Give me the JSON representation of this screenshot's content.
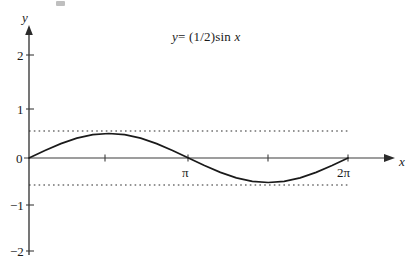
{
  "figure": {
    "title_parts": {
      "lhs": "y",
      "eq": "= (1/2)sin",
      "var": "x"
    },
    "background_color": "#ffffff",
    "ink_color": "#1a1a1a",
    "axis_color": "#3d3d3d"
  },
  "axes": {
    "x_axis_name": "x",
    "y_axis_name": "y",
    "x_ticks": [
      {
        "value": "pi/2",
        "label": ""
      },
      {
        "value": "pi",
        "label": "π"
      },
      {
        "value": "3pi/2",
        "label": ""
      },
      {
        "value": "2pi",
        "label": "2π"
      }
    ],
    "y_ticks": [
      {
        "value": 2,
        "label": "2"
      },
      {
        "value": 1,
        "label": "1"
      },
      {
        "value": 0,
        "label": "0"
      },
      {
        "value": -1,
        "label": "−1"
      },
      {
        "value": -2,
        "label": "−2"
      }
    ],
    "guide_lines": [
      {
        "value": 0.5,
        "style": "dotted"
      },
      {
        "value": -0.5,
        "style": "dotted"
      }
    ]
  },
  "chart_data": {
    "type": "line",
    "xlabel": "x",
    "ylabel": "y",
    "xlim": [
      0,
      7.33
    ],
    "ylim": [
      -2.35,
      2.35
    ],
    "grid": false,
    "legend": "none",
    "amplitude": 0.5,
    "period": 6.283185307,
    "equation": "y = 0.5*sin(x)",
    "xtick_values": [
      1.5707963,
      3.1415927,
      4.712389,
      6.2831853
    ],
    "xtick_labels": [
      "",
      "π",
      "",
      "2π"
    ],
    "ytick_values": [
      2,
      1,
      0,
      -1,
      -2
    ],
    "ytick_labels": [
      "2",
      "1",
      "0",
      "−1",
      "−2"
    ],
    "annotations": [
      {
        "type": "hline",
        "y": 0.5,
        "style": "dotted",
        "x_from": 0,
        "x_to": 6.2831853
      },
      {
        "type": "hline",
        "y": -0.5,
        "style": "dotted",
        "x_from": 0,
        "x_to": 6.2831853
      }
    ],
    "series": [
      {
        "name": "y = (1/2)sin x",
        "x": [
          0,
          0.3141593,
          0.6283185,
          0.9424778,
          1.2566371,
          1.5707963,
          1.8849556,
          2.1991149,
          2.5132741,
          2.8274334,
          3.1415927,
          3.4557519,
          3.7699112,
          4.0840704,
          4.3982297,
          4.712389,
          5.0265482,
          5.3407075,
          5.6548668,
          5.969026,
          6.2831853
        ],
        "y": [
          0,
          0.1545,
          0.2939,
          0.4045,
          0.4755,
          0.5,
          0.4755,
          0.4045,
          0.2939,
          0.1545,
          0,
          -0.1545,
          -0.2939,
          -0.4045,
          -0.4755,
          -0.5,
          -0.4755,
          -0.4045,
          -0.2939,
          -0.1545,
          0
        ]
      }
    ],
    "key_points": [
      {
        "label": "start",
        "x": 0,
        "y": 0
      },
      {
        "label": "maximum",
        "x": 1.5707963,
        "y": 0.5
      },
      {
        "label": "zero-crossing",
        "x": 3.1415927,
        "y": 0
      },
      {
        "label": "minimum",
        "x": 4.712389,
        "y": -0.5
      },
      {
        "label": "end",
        "x": 6.2831853,
        "y": 0
      }
    ]
  }
}
